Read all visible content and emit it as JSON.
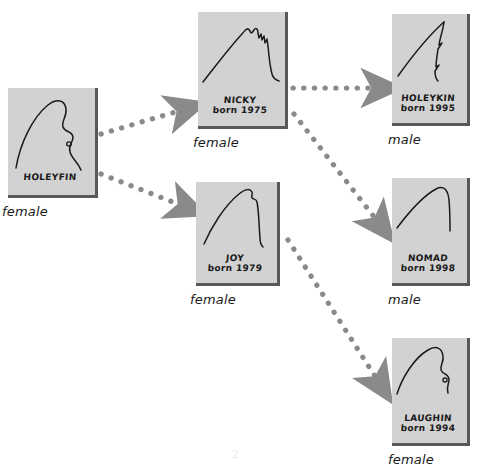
{
  "diagram": {
    "watermark": "2",
    "colors": {
      "card_fill": "#d2d2d2",
      "card_shadow": "#58585a",
      "ink": "#1a1a1a",
      "arrow": "#8a8a8a",
      "background": "#ffffff"
    }
  },
  "nodes": [
    {
      "id": "holeyfin",
      "name": "HOLEYFIN",
      "born": "",
      "sex": "female",
      "fin_style": "rounded-fin-with-notch-and-hole",
      "x": 8,
      "y": 88,
      "w": 90,
      "h": 110
    },
    {
      "id": "nicky",
      "name": "NICKY",
      "born": "born 1975",
      "sex": "female",
      "fin_style": "peaked-fin-with-jagged-trailing-edge",
      "x": 198,
      "y": 12,
      "w": 90,
      "h": 117
    },
    {
      "id": "joy",
      "name": "JOY",
      "born": "born 1979",
      "sex": "female",
      "fin_style": "curved-fin-with-tip-notch",
      "x": 196,
      "y": 182,
      "w": 84,
      "h": 104
    },
    {
      "id": "holeykin",
      "name": "HOLEYKIN",
      "born": "born 1995",
      "sex": "male",
      "fin_style": "slender-pointed-fin-with-notches",
      "x": 392,
      "y": 14,
      "w": 78,
      "h": 112
    },
    {
      "id": "nomad",
      "name": "NOMAD",
      "born": "born 1998",
      "sex": "male",
      "fin_style": "smooth-arched-fin",
      "x": 392,
      "y": 178,
      "w": 78,
      "h": 108
    },
    {
      "id": "laughin",
      "name": "LAUGHIN",
      "born": "born 1994",
      "sex": "female",
      "fin_style": "rounded-fin-with-notch-and-hole",
      "x": 392,
      "y": 338,
      "w": 78,
      "h": 108
    }
  ],
  "edges": [
    {
      "id": "holeyfin-nicky",
      "from": "holeyfin",
      "to": "nicky",
      "style": "dotted-arrow"
    },
    {
      "id": "holeyfin-joy",
      "from": "holeyfin",
      "to": "joy",
      "style": "dotted-arrow"
    },
    {
      "id": "nicky-holeykin",
      "from": "nicky",
      "to": "holeykin",
      "style": "dotted-arrow"
    },
    {
      "id": "nicky-nomad",
      "from": "nicky",
      "to": "nomad",
      "style": "dotted-arrow"
    },
    {
      "id": "joy-laughin",
      "from": "joy",
      "to": "laughin",
      "style": "dotted-arrow"
    }
  ]
}
